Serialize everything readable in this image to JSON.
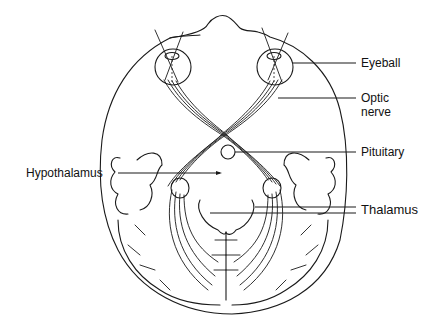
{
  "diagram": {
    "labels": {
      "eyeball": "Eyeball",
      "optic_nerve_line1": "Optic",
      "optic_nerve_line2": "nerve",
      "pituitary": "Pituitary",
      "hypothalamus": "Hypothalamus",
      "thalamus": "Thalamus"
    },
    "colors": {
      "line": "#1a1a1a",
      "background": "#ffffff",
      "text": "#111111"
    }
  }
}
